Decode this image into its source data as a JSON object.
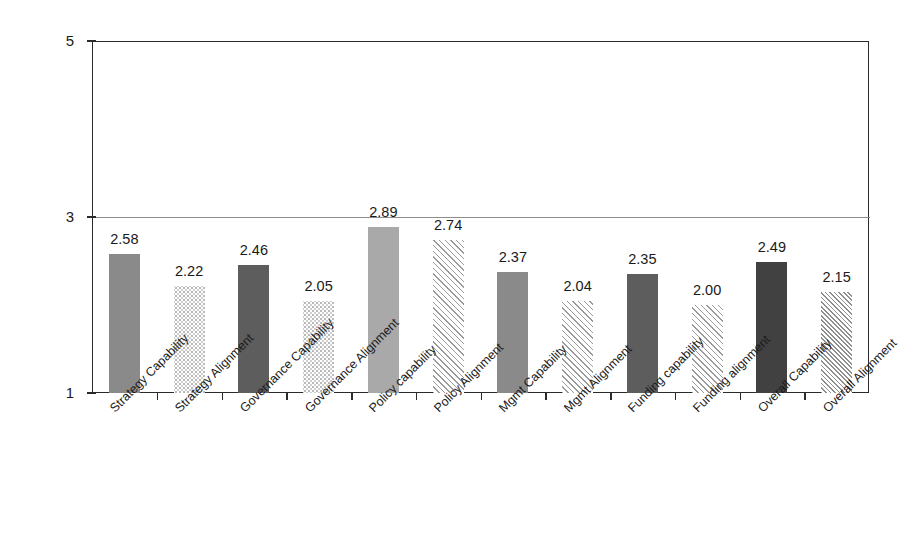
{
  "chart_data": {
    "type": "bar",
    "title": "",
    "xlabel": "",
    "ylabel": "",
    "ylim": [
      1,
      5
    ],
    "yticks": [
      1,
      3,
      5
    ],
    "ytick_labels": [
      "1",
      "3",
      "5"
    ],
    "grid": "horizontal gridline at 3 only",
    "legend": "none",
    "categories": [
      "Strategy Capability",
      "Strategy Alignment",
      "Governance Capability",
      "Governance Alignment",
      "Policy capability",
      "Policy Alignment",
      "Mgmt Capability",
      "Mgmt Alignment",
      "Funding capability",
      "Funding alignment",
      "Overall Capability",
      "Overall Alignment"
    ],
    "values": [
      2.58,
      2.22,
      2.46,
      2.05,
      2.89,
      2.74,
      2.37,
      2.04,
      2.35,
      2.0,
      2.49,
      2.15
    ],
    "value_labels": [
      "2.58",
      "2.22",
      "2.46",
      "2.05",
      "2.89",
      "2.74",
      "2.37",
      "2.04",
      "2.35",
      "2.00",
      "2.49",
      "2.15"
    ],
    "bar_fills": [
      "solid-medium-gray",
      "light-speckle",
      "solid-dark-gray",
      "light-speckle",
      "solid-light-gray",
      "diagonal-hatch",
      "solid-medium-gray",
      "diagonal-hatch",
      "solid-dark-gray",
      "diagonal-hatch",
      "solid-darkest-gray",
      "dense-diagonal-hatch"
    ],
    "colors": {
      "medium_gray": "#8a8a8a",
      "dark_gray": "#5d5d5d",
      "light_gray": "#a9a9a9",
      "darkest_gray": "#414141",
      "axis": "#2b2b2b",
      "gridline": "#8d8d8d",
      "background": "#ffffff",
      "text": "#1a1a1a"
    }
  }
}
